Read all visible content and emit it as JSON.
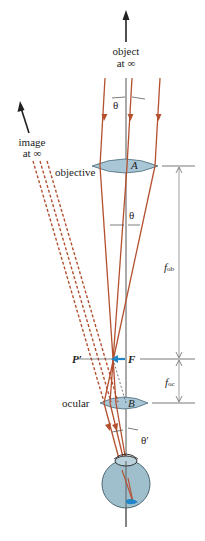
{
  "labels": {
    "object": "object",
    "object_at": "at ∞",
    "image": "image",
    "image_at": "at ∞",
    "objective": "objective",
    "ocular": "ocular",
    "lens_a": "A",
    "lens_b": "B",
    "theta_top": "θ",
    "theta_mid": "θ",
    "theta_prime": "θ′",
    "point_p_prime": "P′",
    "point_f": "F",
    "f_ob_main": "f",
    "f_ob_sub": "ob",
    "f_oc_main": "f",
    "f_oc_sub": "oc"
  },
  "colors": {
    "ray": "#b5502f",
    "lens_fill": "#a9c6d6",
    "eye_fill": "#9fbfcc",
    "axis": "#555555",
    "accent_blue": "#1f86c7"
  }
}
